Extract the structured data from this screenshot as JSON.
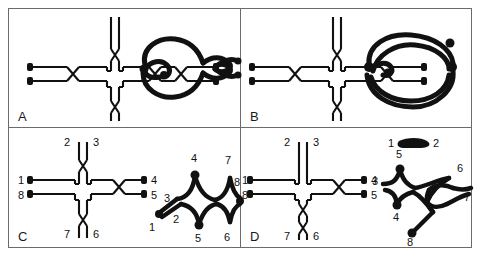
{
  "figure": {
    "kind": "scientific-diagram",
    "panels": [
      {
        "id": "A",
        "letter": "A",
        "left_structure": {
          "name": "cross-junction",
          "crossings": [
            "left-arm-single",
            "right-arm-double",
            "top-arm-single",
            "bottom-arm-single"
          ],
          "terminal_dots": 4,
          "labels": []
        },
        "right_structure": {
          "name": "figure-eight-knot-product",
          "labels": []
        }
      },
      {
        "id": "B",
        "letter": "B",
        "left_structure": {
          "name": "cross-junction",
          "crossings": [
            "left-arm-single",
            "right-arm-single",
            "top-arm-single",
            "bottom-arm-single"
          ],
          "terminal_dots": 4,
          "labels": []
        },
        "right_structure": {
          "name": "closed-loop-product",
          "labels": []
        }
      },
      {
        "id": "C",
        "letter": "C",
        "left_structure": {
          "name": "cross-junction-labelled",
          "crossings": [
            "right-arm-single",
            "top-arm-single",
            "bottom-arm-single"
          ],
          "terminal_dots": 4,
          "labels": [
            "1",
            "2",
            "3",
            "4",
            "5",
            "8",
            "7",
            "6"
          ]
        },
        "right_structure": {
          "name": "double-diamond-chain-product",
          "labels": [
            "1",
            "2",
            "3",
            "4",
            "5",
            "6",
            "7",
            "8"
          ]
        }
      },
      {
        "id": "D",
        "letter": "D",
        "left_structure": {
          "name": "cross-junction-labelled",
          "crossings": [
            "right-arm-single",
            "bottom-arm-double"
          ],
          "terminal_dots": 4,
          "labels": [
            "1",
            "2",
            "3",
            "4",
            "5",
            "8",
            "7",
            "6"
          ]
        },
        "right_structure": {
          "name": "split-product-with-free-hairpin",
          "labels": [
            "1",
            "2",
            "3",
            "4",
            "5",
            "6",
            "7",
            "8"
          ]
        }
      }
    ],
    "colors": {
      "ink": "#111111",
      "border": "#6b6b6b",
      "background": "#ffffff"
    }
  }
}
